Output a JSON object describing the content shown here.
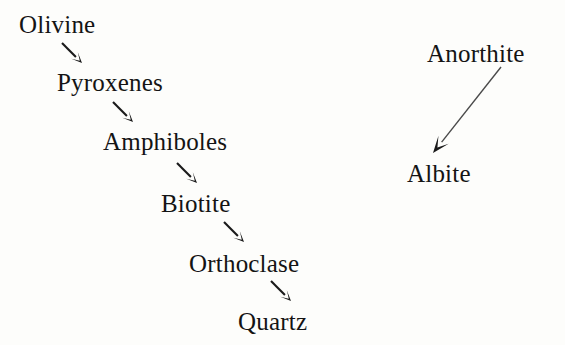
{
  "diagram": {
    "background_color": "#fdfdfb",
    "text_color": "#141414",
    "arrow_color": "#1a1a1a",
    "long_arrow_color": "#4a4a4a",
    "nodes": [
      {
        "id": "olivine",
        "label": "Olivine",
        "x": 19,
        "y": 12,
        "font_size": 25
      },
      {
        "id": "pyroxenes",
        "label": "Pyroxenes",
        "x": 57,
        "y": 70,
        "font_size": 25
      },
      {
        "id": "amphiboles",
        "label": "Amphiboles",
        "x": 103,
        "y": 129,
        "font_size": 25
      },
      {
        "id": "biotite",
        "label": "Biotite",
        "x": 161,
        "y": 191,
        "font_size": 25
      },
      {
        "id": "orthoclase",
        "label": "Orthoclase",
        "x": 189,
        "y": 251,
        "font_size": 25
      },
      {
        "id": "quartz",
        "label": "Quartz",
        "x": 238,
        "y": 309,
        "font_size": 25
      },
      {
        "id": "anorthite",
        "label": "Anorthite",
        "x": 427,
        "y": 41,
        "font_size": 25
      },
      {
        "id": "albite",
        "label": "Albite",
        "x": 407,
        "y": 161,
        "font_size": 25
      }
    ],
    "arrows": [
      {
        "id": "olivine-to-pyroxenes",
        "from": "olivine",
        "to": "pyroxenes",
        "kind": "short",
        "x1": 62,
        "y1": 43,
        "x2": 82,
        "y2": 63
      },
      {
        "id": "pyroxenes-to-amphiboles",
        "from": "pyroxenes",
        "to": "amphiboles",
        "kind": "short",
        "x1": 113,
        "y1": 102,
        "x2": 133,
        "y2": 122
      },
      {
        "id": "amphiboles-to-biotite",
        "from": "amphiboles",
        "to": "biotite",
        "kind": "short",
        "x1": 177,
        "y1": 163,
        "x2": 197,
        "y2": 183
      },
      {
        "id": "biotite-to-orthoclase",
        "from": "biotite",
        "to": "orthoclase",
        "kind": "short",
        "x1": 224,
        "y1": 222,
        "x2": 244,
        "y2": 242
      },
      {
        "id": "orthoclase-to-quartz",
        "from": "orthoclase",
        "to": "quartz",
        "kind": "short",
        "x1": 271,
        "y1": 281,
        "x2": 291,
        "y2": 301
      },
      {
        "id": "anorthite-to-albite",
        "from": "anorthite",
        "to": "albite",
        "kind": "long",
        "x1": 501,
        "y1": 67,
        "x2": 433,
        "y2": 153
      }
    ]
  }
}
